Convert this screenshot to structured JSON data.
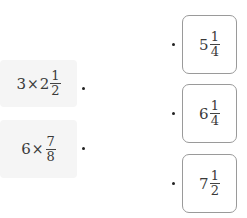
{
  "left_items": [
    {
      "whole1": "3",
      "op": "×",
      "whole2": "2",
      "num": "1",
      "den": "2"
    },
    {
      "whole1": "6",
      "op": "×",
      "whole2": "",
      "num": "7",
      "den": "8"
    }
  ],
  "right_items": [
    {
      "whole": "5",
      "num": "1",
      "den": "4"
    },
    {
      "whole": "6",
      "num": "1",
      "den": "4"
    },
    {
      "whole": "7",
      "num": "1",
      "den": "2"
    }
  ]
}
